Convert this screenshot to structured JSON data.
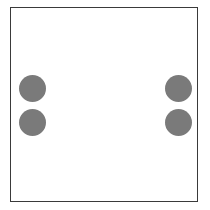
{
  "diagram": {
    "shape": "square-frame",
    "frame_color": "#3a3a3a",
    "dot_color": "#7a7a7a",
    "dot_count": 4,
    "dots": [
      {
        "name": "dot-left-top",
        "cx": 32,
        "cy": 88
      },
      {
        "name": "dot-left-bottom",
        "cx": 32,
        "cy": 122
      },
      {
        "name": "dot-right-top",
        "cx": 178,
        "cy": 88
      },
      {
        "name": "dot-right-bottom",
        "cx": 178,
        "cy": 122
      }
    ]
  }
}
